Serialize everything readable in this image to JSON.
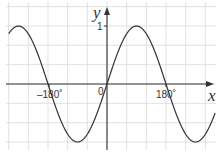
{
  "chart_data": {
    "type": "line",
    "title": "",
    "function": "y = sin x",
    "xlabel": "x",
    "ylabel": "y",
    "x_unit": "degrees",
    "xlim": [
      -325,
      310
    ],
    "ylim": [
      -1.05,
      1.3
    ],
    "grid": true,
    "grid_step_x": 60,
    "grid_step_y": 0.3333,
    "x_tick_labels": [
      "-180°",
      "180°"
    ],
    "x_ticks": [
      -180,
      180
    ],
    "y_tick_labels": [
      "1"
    ],
    "y_ticks": [
      1
    ],
    "origin_label": "0",
    "series": [
      {
        "name": "sin x",
        "x": [
          -300,
          -270,
          -240,
          -210,
          -180,
          -150,
          -120,
          -90,
          -60,
          -30,
          0,
          30,
          60,
          90,
          120,
          150,
          180,
          210,
          240,
          270,
          300
        ],
        "values": [
          0.866,
          1.0,
          0.866,
          0.5,
          0.0,
          -0.5,
          -0.866,
          -1.0,
          -0.866,
          -0.5,
          0.0,
          0.5,
          0.866,
          1.0,
          0.866,
          0.5,
          0.0,
          -0.5,
          -0.866,
          -1.0,
          -0.866
        ]
      }
    ],
    "visible_curve": {
      "x_start": -300,
      "x_end": 330,
      "minimum": {
        "x": -180,
        "y": -1
      },
      "maximum": {
        "x": 180,
        "y": 1
      }
    },
    "colors": {
      "curve": "#333333",
      "axes": "#333333",
      "grid": "#d8d8d8"
    }
  },
  "labels": {
    "x_axis": "x",
    "y_axis": "y",
    "y_one": "1",
    "origin": "0",
    "x_neg180": "–180˚",
    "x_pos180": "180˚"
  }
}
